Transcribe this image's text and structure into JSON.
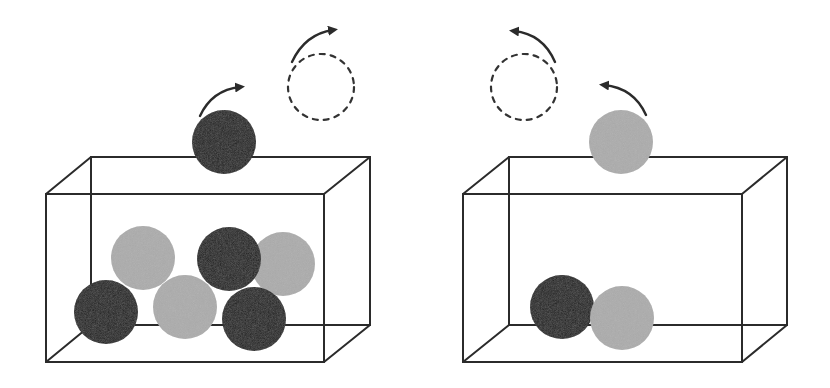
{
  "colors": {
    "background": "#ffffff",
    "line": "#2b2b2b",
    "black_ball": "#1c1c1c",
    "gray_ball": "#acacac",
    "arrow": "#2b2b2b",
    "dashed_circle": "#333333"
  },
  "panels": [
    {
      "name": "left-panel",
      "box": {
        "front": {
          "x1": 46,
          "y1": 194,
          "x2": 324,
          "y2": 362
        },
        "back": {
          "x1": 91,
          "y1": 157,
          "x2": 370,
          "y2": 325
        }
      },
      "balls": [
        {
          "color": "gray",
          "cx": 143,
          "cy": 258,
          "r": 32
        },
        {
          "color": "gray",
          "cx": 283,
          "cy": 264,
          "r": 32
        },
        {
          "color": "black",
          "cx": 229,
          "cy": 259,
          "r": 32
        },
        {
          "color": "black",
          "cx": 106,
          "cy": 312,
          "r": 32
        },
        {
          "color": "gray",
          "cx": 185,
          "cy": 307,
          "r": 32
        },
        {
          "color": "black",
          "cx": 254,
          "cy": 319,
          "r": 32
        }
      ],
      "escaping_ball": {
        "color": "black",
        "cx": 224,
        "cy": 142,
        "r": 32
      },
      "ghost_circle": {
        "cx": 321,
        "cy": 87,
        "r": 33
      },
      "arrows": [
        {
          "name": "small-arrow",
          "d": "M200,116 Q212,90 240,87",
          "tip": [
            244,
            86
          ],
          "direction": "right"
        },
        {
          "name": "large-arrow",
          "d": "M292,62 Q305,34 333,30",
          "tip": [
            337,
            29
          ],
          "direction": "right"
        }
      ]
    },
    {
      "name": "right-panel",
      "box": {
        "front": {
          "x1": 463,
          "y1": 194,
          "x2": 742,
          "y2": 362
        },
        "back": {
          "x1": 509,
          "y1": 157,
          "x2": 787,
          "y2": 325
        }
      },
      "balls": [
        {
          "color": "black",
          "cx": 562,
          "cy": 307,
          "r": 32
        },
        {
          "color": "gray",
          "cx": 622,
          "cy": 318,
          "r": 32
        }
      ],
      "escaping_ball": {
        "color": "gray",
        "cx": 621,
        "cy": 142,
        "r": 32
      },
      "ghost_circle": {
        "cx": 524,
        "cy": 87,
        "r": 33
      },
      "arrows": [
        {
          "name": "large-arrow",
          "d": "M555,62 Q543,34 514,31",
          "tip": [
            510,
            30
          ],
          "direction": "left"
        },
        {
          "name": "small-arrow",
          "d": "M646,115 Q634,88 604,85",
          "tip": [
            600,
            84
          ],
          "direction": "left"
        }
      ]
    }
  ]
}
